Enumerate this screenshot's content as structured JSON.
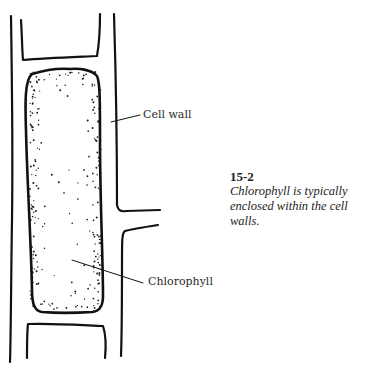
{
  "diagram": {
    "type": "biology-illustration",
    "labels": {
      "cell_wall": "Cell wall",
      "chlorophyll": "Chlorophyll"
    },
    "caption": {
      "figure_number": "15-2",
      "text": "Chlorophyll is typically enclosed within the cell walls."
    },
    "colors": {
      "line": "#111111",
      "dots": "#1a1a1a",
      "background": "#ffffff",
      "text": "#222222"
    }
  }
}
